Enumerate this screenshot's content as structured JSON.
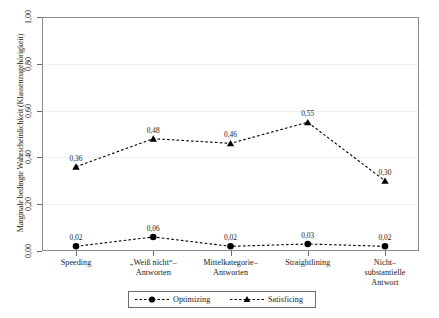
{
  "chart_data": {
    "type": "line",
    "title": "",
    "xlabel": "",
    "ylabel": "Marginale bedingte Wahrscheinlichkeit (Klassenzugehörigkeit)",
    "ylim": [
      0.0,
      1.0
    ],
    "yticks": [
      "0,00",
      "0,20",
      "0,40",
      "0,60",
      "0,80",
      "1,00"
    ],
    "ytick_values": [
      0.0,
      0.2,
      0.4,
      0.6,
      0.8,
      1.0
    ],
    "grid": true,
    "legend_position": "bottom",
    "categories": [
      "Speeding",
      "„Weiß nicht“–\nAntworten",
      "Mittelkategorie–\nAntworten",
      "Straightlining",
      "Nicht–\nsubstantielle\nAntwort"
    ],
    "series": [
      {
        "name": "Optimizing",
        "marker": "circle",
        "linestyle": "dashed",
        "color": "#000000",
        "values": [
          0.02,
          0.06,
          0.02,
          0.03,
          0.02
        ],
        "labels": [
          "0,02",
          "0,06",
          "0,02",
          "0,03",
          "0,02"
        ]
      },
      {
        "name": "Satisficing",
        "marker": "triangle",
        "linestyle": "dashed",
        "color": "#000000",
        "values": [
          0.36,
          0.48,
          0.46,
          0.55,
          0.3
        ],
        "labels": [
          "0,36",
          "0,48",
          "0,46",
          "0,55",
          "0,30"
        ]
      }
    ]
  },
  "legend": {
    "items": [
      {
        "label": "Optimizing"
      },
      {
        "label": "Satisficing"
      }
    ]
  }
}
